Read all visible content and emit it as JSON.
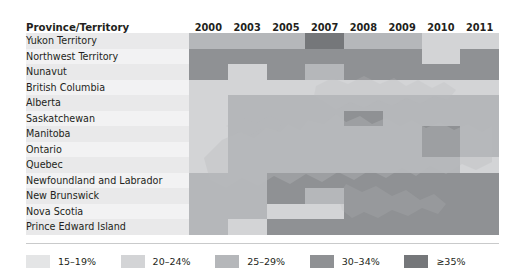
{
  "chart_data": {
    "type": "heatmap",
    "title": "",
    "xlabel": "",
    "ylabel": "Province/Territory",
    "legend_position": "bottom",
    "grid": true,
    "row_header": "Province/Territory",
    "categories": [
      "2000",
      "2003",
      "2005",
      "2007",
      "2008",
      "2009",
      "2010",
      "2011"
    ],
    "scale": [
      {
        "key": "s1",
        "label": "15–19%",
        "color": "#e4e5e6",
        "min": 15,
        "max": 19
      },
      {
        "key": "s2",
        "label": "20–24%",
        "color": "#d3d4d6",
        "min": 20,
        "max": 24
      },
      {
        "key": "s3",
        "label": "25–29%",
        "color": "#b5b7ba",
        "min": 25,
        "max": 29
      },
      {
        "key": "s4",
        "label": "30–34%",
        "color": "#8f9194",
        "min": 30,
        "max": 34
      },
      {
        "key": "s5",
        "label": "≥35%",
        "color": "#75777a",
        "min": 35,
        "max": null
      }
    ],
    "rows": [
      {
        "label": "Yukon Territory",
        "values": [
          "s3",
          "s3",
          "s3",
          "s5",
          "s3",
          "s3",
          "s2",
          "s2"
        ]
      },
      {
        "label": "Northwest Territory",
        "values": [
          "s4",
          "s4",
          "s4",
          "s4",
          "s4",
          "s4",
          "s2",
          "s4"
        ]
      },
      {
        "label": "Nunavut",
        "values": [
          "s4",
          "s2",
          "s4",
          "s3",
          "s4",
          "s4",
          "s4",
          "s4"
        ]
      },
      {
        "label": "British Columbia",
        "values": [
          "s2",
          "s2",
          "s2",
          "s2",
          "s2",
          "s2",
          "s2",
          "s2"
        ]
      },
      {
        "label": "Alberta",
        "values": [
          "s2",
          "s3",
          "s3",
          "s3",
          "s3",
          "s3",
          "s3",
          "s3"
        ]
      },
      {
        "label": "Saskatchewan",
        "values": [
          "s2",
          "s3",
          "s3",
          "s3",
          "s4",
          "s3",
          "s3",
          "s3"
        ]
      },
      {
        "label": "Manitoba",
        "values": [
          "s2",
          "s3",
          "s3",
          "s3",
          "s3",
          "s3",
          "s4",
          "s3"
        ]
      },
      {
        "label": "Ontario",
        "values": [
          "s2",
          "s3",
          "s3",
          "s3",
          "s3",
          "s3",
          "s4",
          "s3"
        ]
      },
      {
        "label": "Quebec",
        "values": [
          "s2",
          "s3",
          "s3",
          "s3",
          "s3",
          "s3",
          "s3",
          "s2"
        ]
      },
      {
        "label": "Newfoundland and Labrador",
        "values": [
          "s3",
          "s3",
          "s4",
          "s4",
          "s4",
          "s4",
          "s4",
          "s4"
        ]
      },
      {
        "label": "New Brunswick",
        "values": [
          "s3",
          "s3",
          "s4",
          "s3",
          "s4",
          "s4",
          "s4",
          "s4"
        ]
      },
      {
        "label": "Nova Scotia",
        "values": [
          "s3",
          "s3",
          "s2",
          "s2",
          "s4",
          "s4",
          "s4",
          "s4"
        ]
      },
      {
        "label": "Prince Edward Island",
        "values": [
          "s3",
          "s2",
          "s4",
          "s4",
          "s4",
          "s4",
          "s4",
          "s4"
        ]
      }
    ]
  }
}
